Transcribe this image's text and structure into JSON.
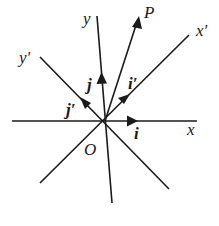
{
  "diagram": {
    "axes": [
      {
        "name": "x",
        "label": "x",
        "unit_vector": "i"
      },
      {
        "name": "y",
        "label": "y",
        "unit_vector": "j"
      },
      {
        "name": "x-prime",
        "label": "x′",
        "unit_vector": "i′"
      },
      {
        "name": "y-prime",
        "label": "y′",
        "unit_vector": "j′"
      }
    ],
    "origin_label": "O",
    "point_label": "P",
    "colors": {
      "ink": "#1a1a1a",
      "background": "#ffffff"
    }
  }
}
